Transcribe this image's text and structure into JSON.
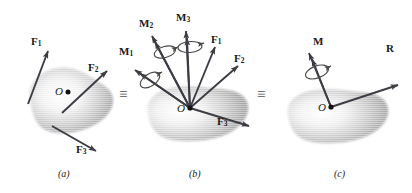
{
  "figure": {
    "type": "mechanics-free-body-diagram",
    "equivalence_symbol": "≡",
    "body_shape": "irregular-blob",
    "colors": {
      "ink": "#1a1a1a",
      "arrow": "#3c3c44",
      "blob_fill": "#b8b8b8",
      "blob_highlight": "#ffffff",
      "spiral": "#4a4a4a",
      "background": "#ffffff"
    }
  },
  "panels": [
    {
      "id": "a",
      "caption": "(a)",
      "origin_label": "O",
      "vectors": [
        {
          "name": "F1",
          "label": "F",
          "sub": "1",
          "kind": "force"
        },
        {
          "name": "F2",
          "label": "F",
          "sub": "2",
          "kind": "force"
        },
        {
          "name": "F3",
          "label": "F",
          "sub": "3",
          "kind": "force"
        }
      ]
    },
    {
      "id": "b",
      "caption": "(b)",
      "origin_label": "O",
      "vectors": [
        {
          "name": "M1",
          "label": "M",
          "sub": "1",
          "kind": "moment"
        },
        {
          "name": "M2",
          "label": "M",
          "sub": "2",
          "kind": "moment"
        },
        {
          "name": "M3",
          "label": "M",
          "sub": "3",
          "kind": "moment"
        },
        {
          "name": "F1",
          "label": "F",
          "sub": "1",
          "kind": "force"
        },
        {
          "name": "F2",
          "label": "F",
          "sub": "2",
          "kind": "force"
        },
        {
          "name": "F3",
          "label": "F",
          "sub": "3",
          "kind": "force"
        }
      ]
    },
    {
      "id": "c",
      "caption": "(c)",
      "origin_label": "O",
      "vectors": [
        {
          "name": "M",
          "label": "M",
          "sub": "",
          "kind": "moment"
        },
        {
          "name": "R",
          "label": "R",
          "sub": "",
          "kind": "force"
        }
      ]
    }
  ],
  "equivalences": [
    {
      "name": "equiv-a-b",
      "symbol": "≡"
    },
    {
      "name": "equiv-b-c",
      "symbol": "≡"
    }
  ]
}
